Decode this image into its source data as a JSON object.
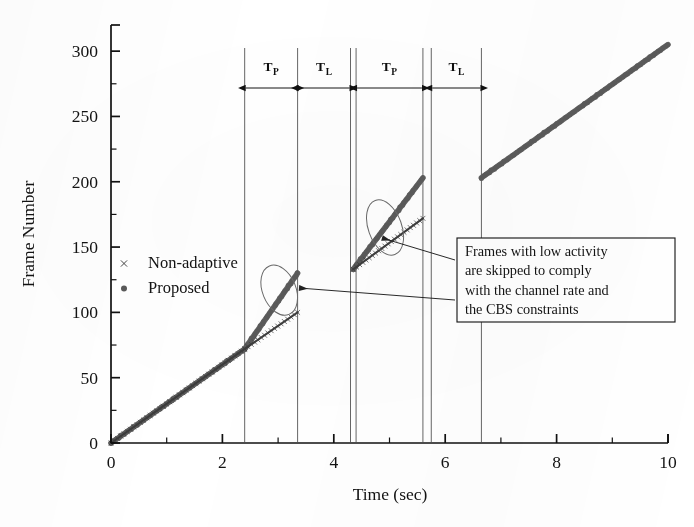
{
  "figure": {
    "background_color": "#ffffff",
    "ink_color": "#1a1a1a",
    "series_color": "#4d4d4d",
    "plot_left_px": 111,
    "plot_right_px": 668,
    "plot_top_px": 25,
    "plot_bottom_px": 443
  },
  "chart_data": {
    "type": "line",
    "title": "",
    "subtitle": "",
    "xlabel": "Time (sec)",
    "ylabel": "Frame Number",
    "xlim": [
      0,
      10
    ],
    "ylim": [
      0,
      320
    ],
    "xticks": [
      0,
      2,
      4,
      6,
      8,
      10
    ],
    "xtick_labels": [
      "0",
      "2",
      "4",
      "6",
      "8",
      "10"
    ],
    "xminor_step": 1,
    "yticks": [
      0,
      50,
      100,
      150,
      200,
      250,
      300
    ],
    "ytick_labels": [
      "0",
      "50",
      "100",
      "150",
      "200",
      "250",
      "300"
    ],
    "yminor_step": 25,
    "grid": false,
    "legend_position": "center-left",
    "series": [
      {
        "name": "Non-adaptive",
        "marker": "x",
        "marker_glyph": "×",
        "color": "#3c3c3c",
        "segments": [
          [
            [
              0.0,
              0
            ],
            [
              2.4,
              72
            ]
          ],
          [
            [
              2.4,
              72
            ],
            [
              3.35,
              100
            ]
          ],
          [
            [
              4.35,
              133
            ],
            [
              5.6,
              172
            ]
          ]
        ]
      },
      {
        "name": "Proposed",
        "marker": "dot",
        "marker_glyph": "●",
        "color": "#5a5a5a",
        "segments": [
          [
            [
              0.0,
              0
            ],
            [
              2.4,
              72
            ]
          ],
          [
            [
              2.4,
              72
            ],
            [
              3.35,
              130
            ]
          ],
          [
            [
              4.35,
              133
            ],
            [
              5.6,
              203
            ]
          ],
          [
            [
              6.65,
              203
            ],
            [
              10.0,
              305
            ]
          ]
        ]
      }
    ],
    "vertical_dividers": [
      2.4,
      3.35,
      4.3,
      4.4,
      5.6,
      5.75,
      6.65
    ],
    "brackets": [
      {
        "label": "T",
        "subscript": "P",
        "from": 2.4,
        "to": 3.35
      },
      {
        "label": "T",
        "subscript": "L",
        "from": 3.35,
        "to": 4.3
      },
      {
        "label": "T",
        "subscript": "P",
        "from": 4.4,
        "to": 5.6
      },
      {
        "label": "T",
        "subscript": "L",
        "from": 5.75,
        "to": 6.65
      }
    ],
    "ellipse_highlights": [
      {
        "cx": 3.02,
        "cy": 117,
        "rx": 0.3,
        "ry": 20,
        "rotation_deg": -22
      },
      {
        "cx": 4.92,
        "cy": 165,
        "rx": 0.3,
        "ry": 22,
        "rotation_deg": -20
      }
    ],
    "annotations": [
      {
        "id": "callout",
        "lines": [
          "Frames with low activity",
          "are skipped to comply",
          "with the channel rate and",
          "the CBS constraints"
        ],
        "box_x_px": 457,
        "box_y_px": 238,
        "box_w_px": 218,
        "box_h_px": 84,
        "arrow_targets": [
          {
            "x_px": 299,
            "y_px": 288
          },
          {
            "x_px": 382,
            "y_px": 238
          }
        ]
      }
    ]
  },
  "legend": {
    "entries": [
      {
        "label": "Non-adaptive",
        "marker_glyph": "×"
      },
      {
        "label": "Proposed",
        "marker_glyph": "●"
      }
    ]
  },
  "axis_labels": {
    "x_title": "Time (sec)",
    "y_title": "Frame Number"
  }
}
